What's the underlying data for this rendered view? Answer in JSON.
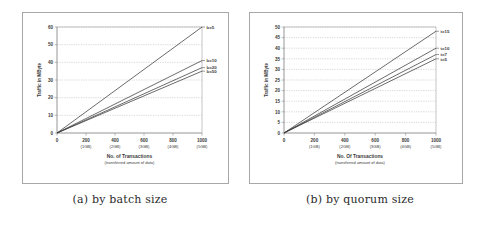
{
  "figure": {
    "panels": [
      {
        "id": "panel-a",
        "caption": "(a) by batch size",
        "chart_data": {
          "type": "line",
          "title": "",
          "xlabel": "No. of Transactions",
          "xlabel_sub": "(transferred amount of data)",
          "ylabel": "Traffic in MByte",
          "xlim": [
            0,
            1000
          ],
          "ylim": [
            0,
            60
          ],
          "grid": true,
          "legend_position": "right-of-line-ends",
          "xticks": [
            0,
            200,
            400,
            600,
            800,
            1000
          ],
          "xticklabels": [
            "0",
            "200",
            "400",
            "600",
            "800",
            "1000"
          ],
          "xticklabels_sub": [
            "",
            "(1GB)",
            "(2GB)",
            "(3GB)",
            "(4GB)",
            "(5GB)"
          ],
          "yticks": [
            0,
            10,
            20,
            30,
            40,
            50,
            60
          ],
          "yticklabels": [
            "0",
            "10",
            "20",
            "30",
            "40",
            "50",
            "60"
          ],
          "x": [
            0,
            1000
          ],
          "series": [
            {
              "name": "b=5",
              "values": [
                0,
                60.0
              ]
            },
            {
              "name": "b=10",
              "values": [
                0,
                41.0
              ]
            },
            {
              "name": "b=20",
              "values": [
                0,
                37.0
              ]
            },
            {
              "name": "b=50",
              "values": [
                0,
                35.0
              ]
            }
          ]
        }
      },
      {
        "id": "panel-b",
        "caption": "(b) by quorum size",
        "chart_data": {
          "type": "line",
          "title": "",
          "xlabel": "No. Of Transactions",
          "xlabel_sub": "(transferred amount of data)",
          "ylabel": "Traffic in MByte",
          "xlim": [
            0,
            1000
          ],
          "ylim": [
            0,
            50
          ],
          "grid": true,
          "legend_position": "right-of-line-ends",
          "xticks": [
            0,
            200,
            400,
            600,
            800,
            1000
          ],
          "xticklabels": [
            "0",
            "200",
            "400",
            "600",
            "800",
            "1000"
          ],
          "xticklabels_sub": [
            "",
            "(1GB)",
            "(2GB)",
            "(3GB)",
            "(4GB)",
            "(5GB)"
          ],
          "yticks": [
            0,
            5,
            10,
            15,
            20,
            25,
            30,
            35,
            40,
            45,
            50
          ],
          "yticklabels": [
            "0",
            "5",
            "10",
            "15",
            "20",
            "25",
            "30",
            "35",
            "40",
            "45",
            "50"
          ],
          "x": [
            0,
            1000
          ],
          "series": [
            {
              "name": "t=15",
              "values": [
                0,
                48.0
              ]
            },
            {
              "name": "t=10",
              "values": [
                0,
                40.0
              ]
            },
            {
              "name": "t=7",
              "values": [
                0,
                37.0
              ]
            },
            {
              "name": "t=5",
              "values": [
                0,
                35.0
              ]
            }
          ]
        }
      }
    ],
    "colors": {
      "line": "#3a3a3a",
      "grid": "#9a9a9a",
      "axis": "#8a8a8a",
      "frame": "#a8a8a8",
      "text": "#3a3a3a",
      "background": "#ffffff"
    }
  }
}
